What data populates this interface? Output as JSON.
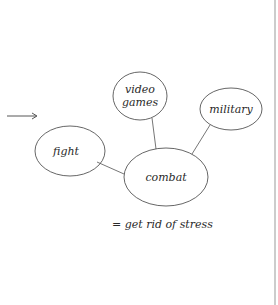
{
  "diagram": {
    "nodes": [
      {
        "id": "video_games",
        "lines": [
          "video",
          "games"
        ]
      },
      {
        "id": "military",
        "label": "military"
      },
      {
        "id": "fight",
        "label": "fight"
      },
      {
        "id": "combat",
        "label": "combat"
      }
    ],
    "edges": [
      [
        "video_games",
        "combat"
      ],
      [
        "military",
        "combat"
      ],
      [
        "fight",
        "combat"
      ]
    ],
    "arrow": "→",
    "caption": "= get rid of stress"
  }
}
